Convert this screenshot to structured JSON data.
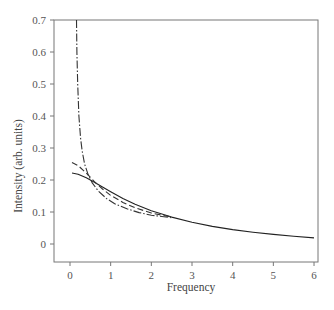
{
  "chart_data": {
    "type": "line",
    "title": "",
    "xlabel": "Frequency",
    "ylabel": "Intensity (arb. units)",
    "xlim": [
      -0.3,
      6.1
    ],
    "ylim": [
      -0.056,
      0.7
    ],
    "x_ticks": [
      0,
      1,
      2,
      3,
      4,
      5,
      6
    ],
    "x_tick_labels": [
      "0",
      "1",
      "2",
      "3",
      "4",
      "5",
      "6"
    ],
    "y_ticks": [
      0,
      0.1,
      0.2,
      0.3,
      0.4,
      0.5,
      0.6,
      0.7
    ],
    "y_tick_labels": [
      "0",
      "0.1",
      "0.2",
      "0.3",
      "0.4",
      "0.5",
      "0.6",
      "0.7"
    ],
    "grid": false,
    "legend": null,
    "series": [
      {
        "name": "solid",
        "style": "solid",
        "color": "#222222",
        "x": [
          0.05,
          0.2,
          0.4,
          0.6,
          0.8,
          1.0,
          1.3,
          1.6,
          2.0,
          2.5,
          3.0,
          3.5,
          4.0,
          4.5,
          5.0,
          5.5,
          6.0
        ],
        "y": [
          0.222,
          0.218,
          0.207,
          0.193,
          0.178,
          0.163,
          0.142,
          0.124,
          0.104,
          0.084,
          0.068,
          0.055,
          0.045,
          0.037,
          0.03,
          0.024,
          0.019
        ]
      },
      {
        "name": "dashed",
        "style": "dashed",
        "color": "#333333",
        "x": [
          0.05,
          0.2,
          0.4,
          0.6,
          0.8,
          1.0,
          1.3,
          1.6,
          2.0,
          2.5
        ],
        "y": [
          0.255,
          0.245,
          0.222,
          0.195,
          0.172,
          0.152,
          0.13,
          0.113,
          0.097,
          0.084
        ]
      },
      {
        "name": "dash-dot",
        "style": "dashdot",
        "color": "#333333",
        "x": [
          0.16,
          0.17,
          0.19,
          0.22,
          0.26,
          0.3,
          0.36,
          0.45,
          0.55,
          0.7,
          0.9,
          1.1,
          1.4,
          1.7,
          2.0,
          2.5
        ],
        "y": [
          0.7,
          0.6,
          0.5,
          0.4,
          0.33,
          0.29,
          0.25,
          0.215,
          0.19,
          0.165,
          0.142,
          0.126,
          0.11,
          0.098,
          0.09,
          0.082
        ]
      }
    ]
  },
  "layout": {
    "plot_left": 54,
    "plot_right": 318,
    "plot_top": 20,
    "plot_bottom": 262,
    "x0_px": 70,
    "px_per_x": 40.67,
    "y0_px": 244,
    "px_per_y": 320
  }
}
